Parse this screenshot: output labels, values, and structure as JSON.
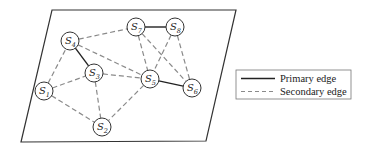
{
  "diagram": {
    "type": "network-graph",
    "plane": {
      "corners": [
        [
          52,
          10
        ],
        [
          236,
          10
        ],
        [
          206,
          141
        ],
        [
          21,
          142
        ]
      ],
      "stroke": "#333333"
    },
    "node_radius": 9,
    "nodes": [
      {
        "id": "S1",
        "letter": "S",
        "sub": "1",
        "x": 44,
        "y": 91
      },
      {
        "id": "S2",
        "letter": "S",
        "sub": "2",
        "x": 102,
        "y": 127
      },
      {
        "id": "S3",
        "letter": "S",
        "sub": "3",
        "x": 94,
        "y": 73
      },
      {
        "id": "S4",
        "letter": "S",
        "sub": "4",
        "x": 70,
        "y": 41
      },
      {
        "id": "S5",
        "letter": "S",
        "sub": "5",
        "x": 150,
        "y": 79
      },
      {
        "id": "S6",
        "letter": "S",
        "sub": "6",
        "x": 192,
        "y": 88
      },
      {
        "id": "S7",
        "letter": "S",
        "sub": "7",
        "x": 136,
        "y": 27
      },
      {
        "id": "S8",
        "letter": "S",
        "sub": "8",
        "x": 175,
        "y": 27
      }
    ],
    "edges": [
      {
        "from": "S4",
        "to": "S3",
        "type": "primary"
      },
      {
        "from": "S7",
        "to": "S8",
        "type": "primary"
      },
      {
        "from": "S5",
        "to": "S6",
        "type": "primary"
      },
      {
        "from": "S1",
        "to": "S4",
        "type": "secondary"
      },
      {
        "from": "S1",
        "to": "S3",
        "type": "secondary"
      },
      {
        "from": "S1",
        "to": "S2",
        "type": "secondary"
      },
      {
        "from": "S3",
        "to": "S2",
        "type": "secondary"
      },
      {
        "from": "S3",
        "to": "S5",
        "type": "secondary"
      },
      {
        "from": "S4",
        "to": "S7",
        "type": "secondary"
      },
      {
        "from": "S4",
        "to": "S5",
        "type": "secondary"
      },
      {
        "from": "S5",
        "to": "S2",
        "type": "secondary"
      },
      {
        "from": "S7",
        "to": "S5",
        "type": "secondary"
      },
      {
        "from": "S7",
        "to": "S6",
        "type": "secondary"
      },
      {
        "from": "S8",
        "to": "S5",
        "type": "secondary"
      },
      {
        "from": "S8",
        "to": "S6",
        "type": "secondary"
      }
    ],
    "colors": {
      "primary_edge": "#222222",
      "secondary_edge": "#8a8a8a",
      "node_stroke": "#333333",
      "node_fill": "#ffffff"
    }
  },
  "legend": {
    "items": [
      {
        "label": "Primary edge",
        "style": "solid"
      },
      {
        "label": "Secondary edge",
        "style": "dashed"
      }
    ]
  }
}
